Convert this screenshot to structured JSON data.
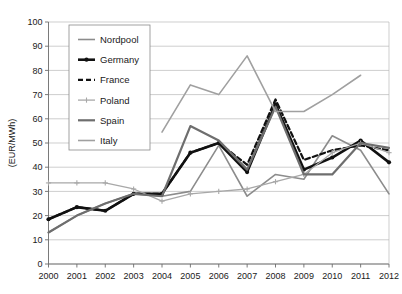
{
  "chart_data": {
    "type": "line",
    "title": "",
    "xlabel": "",
    "ylabel": "(EUR/MWh)",
    "xlim": [
      2000,
      2012
    ],
    "ylim": [
      0,
      100
    ],
    "ytick_step": 10,
    "grid": true,
    "legend_position": "top-left-inside",
    "categories": [
      2000,
      2001,
      2002,
      2003,
      2004,
      2005,
      2006,
      2007,
      2008,
      2009,
      2010,
      2011,
      2012
    ],
    "yticks": [
      0,
      10,
      20,
      30,
      40,
      50,
      60,
      70,
      80,
      90,
      100
    ],
    "xticks": [
      "2000",
      "2001",
      "2002",
      "2003",
      "2004",
      "2005",
      "2006",
      "2007",
      "2008",
      "2009",
      "2010",
      "2011",
      "2012"
    ],
    "series": [
      {
        "name": "Nordpool",
        "color": "#8c8c8c",
        "width": 1.6,
        "dash": "none",
        "marker": "none",
        "values": [
          13,
          20,
          25,
          29,
          28,
          30,
          49,
          28,
          37,
          35,
          53,
          47,
          29
        ]
      },
      {
        "name": "Germany",
        "color": "#111111",
        "width": 2.6,
        "dash": "none",
        "marker": "dot",
        "values": [
          18.5,
          23.5,
          22,
          29,
          29,
          46,
          50,
          38,
          66,
          39,
          44,
          51,
          42
        ]
      },
      {
        "name": "France",
        "color": "#111111",
        "width": 2.2,
        "dash": "5,3",
        "marker": "none",
        "values": [
          18.5,
          23.5,
          22,
          29,
          29,
          46,
          50,
          41,
          68,
          43,
          47,
          49,
          47
        ]
      },
      {
        "name": "Poland",
        "color": "#a8a8a8",
        "width": 1.3,
        "dash": "none",
        "marker": "plus",
        "values": [
          33.5,
          33.5,
          33.5,
          31,
          26,
          29,
          30,
          31,
          34,
          37,
          46,
          50,
          46
        ]
      },
      {
        "name": "Spain",
        "color": "#6e6e6e",
        "width": 2.2,
        "dash": "none",
        "marker": "none",
        "values": [
          13,
          20,
          25,
          29,
          28,
          57,
          51,
          39,
          65,
          37,
          37,
          50,
          48
        ]
      },
      {
        "name": "Italy",
        "color": "#a0a0a0",
        "width": 1.6,
        "dash": "none",
        "marker": "none",
        "values": [
          null,
          null,
          null,
          null,
          54.5,
          74,
          70,
          86,
          63,
          63,
          70,
          78,
          null
        ]
      }
    ]
  },
  "legend": {
    "entries": [
      {
        "label": "Nordpool"
      },
      {
        "label": "Germany"
      },
      {
        "label": "France"
      },
      {
        "label": "Poland"
      },
      {
        "label": "Spain"
      },
      {
        "label": "Italy"
      }
    ]
  }
}
